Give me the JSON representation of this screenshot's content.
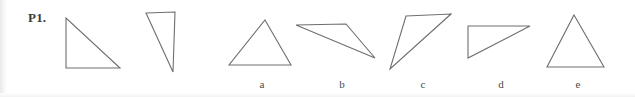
{
  "figure": {
    "problem_label": "P1.",
    "stroke_color": "#6e6e6e",
    "background_color": "#ffffff",
    "label_color": "#4a4a4a",
    "stroke_width": 1.1,
    "width": 635,
    "height": 97
  },
  "shapes": [
    {
      "id": "reference-triangle-1",
      "label": "",
      "label_x": 0,
      "label_y": 0,
      "points": "66,18 66,68 120,68",
      "description": "right triangle, right angle at bottom-left"
    },
    {
      "id": "reference-triangle-2",
      "label": "",
      "label_x": 0,
      "label_y": 0,
      "points": "146,13 175,12 173,72",
      "description": "narrow right triangle, right angle at top-right"
    },
    {
      "id": "option-a",
      "label": "a",
      "label_x": 258,
      "label_y": 79,
      "points": "265,20 291,65 229,65",
      "description": "acute isosceles triangle pointing up"
    },
    {
      "id": "option-b",
      "label": "b",
      "label_x": 338,
      "label_y": 79,
      "points": "296,25 346,24 375,58",
      "description": "thin obtuse sliver triangle"
    },
    {
      "id": "option-c",
      "label": "c",
      "label_x": 419,
      "label_y": 79,
      "points": "406,16 451,14 390,69",
      "description": "slanted triangle, apex lower-left"
    },
    {
      "id": "option-d",
      "label": "d",
      "label_x": 497,
      "label_y": 79,
      "points": "468,26 530,26 468,58",
      "description": "right triangle, right angle at top-left"
    },
    {
      "id": "option-e",
      "label": "e",
      "label_x": 574,
      "label_y": 79,
      "points": "574,15 604,67 547,67",
      "description": "tall acute isosceles triangle pointing up"
    }
  ]
}
